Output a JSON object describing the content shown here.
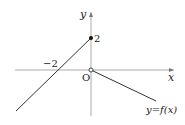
{
  "figure": {
    "type": "function-graph",
    "axes": {
      "x_label": "x",
      "y_label": "y",
      "origin_label": "O"
    },
    "tick_labels": {
      "x_neg2": "−2",
      "y_2": "2"
    },
    "curve_label": "y=f(x)",
    "pieces": [
      {
        "description": "line through (-2,0) and (0,2), closed endpoint at (0,2)",
        "endpoint": [
          0,
          2
        ],
        "endpoint_style": "filled"
      },
      {
        "description": "ray from (0,0) decreasing to the right, open endpoint at origin",
        "endpoint": [
          0,
          0
        ],
        "endpoint_style": "open"
      }
    ],
    "colors": {
      "axis": "#999999",
      "curve": "#333333",
      "text": "#222222"
    }
  }
}
